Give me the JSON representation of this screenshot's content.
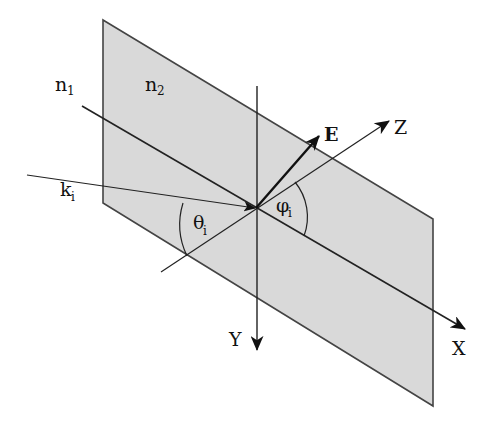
{
  "diagram": {
    "colors": {
      "plane_fill": "#d9d9d9",
      "plane_edge": "#444444",
      "line": "#222222",
      "background": "#ffffff"
    },
    "labels": {
      "n1": {
        "base": "n",
        "sub": "1"
      },
      "n2": {
        "base": "n",
        "sub": "2"
      },
      "ki": {
        "base": "k",
        "sub": "i"
      },
      "theta": {
        "base": "θ",
        "sub": "i"
      },
      "phi": {
        "base": "φ",
        "sub": "i"
      },
      "E": "E",
      "X": "X",
      "Y": "Y",
      "Z": "Z"
    },
    "elements": [
      "interface plane (parallelogram)",
      "X axis (surface normal direction)",
      "Y axis (vertical)",
      "Z axis",
      "incident wave vector k_i",
      "electric field vector E",
      "angle of incidence θ_i",
      "polarization angle φ_i"
    ]
  }
}
